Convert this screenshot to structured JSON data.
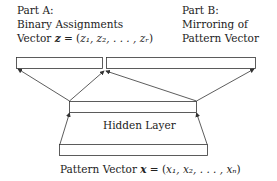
{
  "diagram": {
    "part_a": {
      "line1": "Part A:",
      "line2": "Binary Assignments",
      "line3_prefix": "Vector ",
      "line3_var": "z",
      "line3_eq": " = (",
      "line3_tuple": "z₁, z₂, . . . , zᵣ",
      "line3_close": ")"
    },
    "part_b": {
      "line1": "Part B:",
      "line2": "Mirroring of",
      "line3": "Pattern Vector"
    },
    "hidden_layer": {
      "label": "Hidden Layer"
    },
    "input": {
      "prefix": "Pattern Vector ",
      "var": "x",
      "eq": " = (",
      "tuple": "x₁, x₂, . . . , xₙ",
      "close": ")"
    },
    "colors": {
      "stroke": "#333333",
      "text": "#222222",
      "background": "#ffffff"
    }
  }
}
